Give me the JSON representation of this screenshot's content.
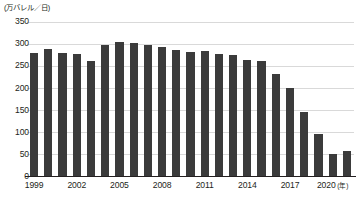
{
  "chart_data": {
    "type": "bar",
    "title": "",
    "subtitle": "",
    "unit_label": "(万バレル／日)",
    "xlabel": "",
    "xlabel_unit": "(年)",
    "ylabel": "",
    "ylim": [
      0,
      350
    ],
    "ytick_step": 50,
    "grid": true,
    "legend": "none",
    "bar_color": "#3b3b3b",
    "categories": [
      "1999",
      "2000",
      "2001",
      "2002",
      "2003",
      "2004",
      "2005",
      "2006",
      "2007",
      "2008",
      "2009",
      "2010",
      "2011",
      "2012",
      "2013",
      "2014",
      "2015",
      "2016",
      "2017",
      "2018",
      "2019",
      "2020",
      "2021"
    ],
    "values": [
      278,
      288,
      278,
      276,
      261,
      298,
      304,
      301,
      296,
      293,
      285,
      281,
      284,
      277,
      275,
      263,
      260,
      231,
      199,
      146,
      96,
      51,
      57
    ],
    "ytick_labels": [
      "350",
      "300",
      "250",
      "200",
      "150",
      "100",
      "50",
      "0"
    ],
    "ytick_values": [
      350,
      300,
      250,
      200,
      150,
      100,
      50,
      0
    ],
    "xtick_labels": [
      "1999",
      "2002",
      "2005",
      "2008",
      "2011",
      "2014",
      "2017",
      "2020"
    ],
    "xtick_categories": [
      "1999",
      "2002",
      "2005",
      "2008",
      "2011",
      "2014",
      "2017",
      "2020"
    ]
  }
}
